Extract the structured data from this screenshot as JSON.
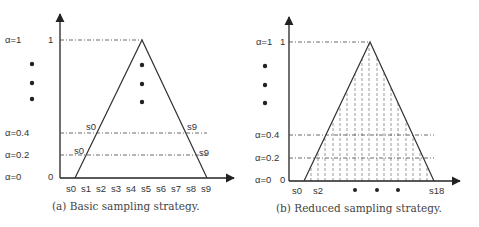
{
  "figures": [
    {
      "id": "a",
      "caption": "(a) Basic sampling strategy.",
      "y_tick_top": "1",
      "y_tick_zero": "0",
      "alpha_labels": {
        "top": "α=1",
        "p4": "α=0.4",
        "p2": "α=0.2",
        "zero": "α=0"
      },
      "x_labels": [
        "s0",
        "s1",
        "s2",
        "s3",
        "s4",
        "s5",
        "s6",
        "s7",
        "s8",
        "s9"
      ],
      "cut_labels": {
        "left_04": "s0",
        "right_04": "s9",
        "left_02": "s0",
        "right_02": "s9"
      }
    },
    {
      "id": "b",
      "caption": "(b) Reduced sampling strategy.",
      "y_tick_top": "1",
      "y_tick_zero": "0",
      "alpha_labels": {
        "top": "α=1",
        "p4": "α=0.4",
        "p2": "α=0.2",
        "zero": "α=0"
      },
      "x_labels": {
        "first": "s0",
        "second": "s2",
        "last": "s18"
      },
      "sample_count": 19
    }
  ]
}
